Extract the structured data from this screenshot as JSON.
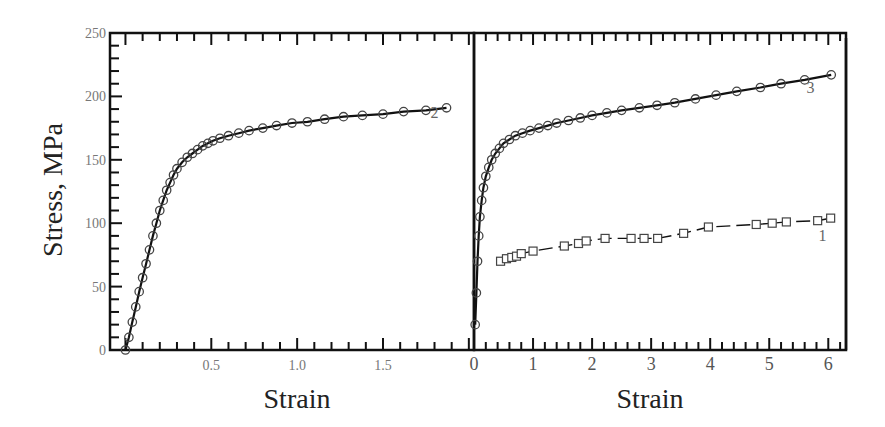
{
  "chart_data": [
    {
      "type": "scatter",
      "panel": "left",
      "title": "",
      "xlabel": "Strain",
      "ylabel": "Stress, MPa",
      "xlim": [
        -0.09,
        2.03
      ],
      "ylim": [
        0,
        250
      ],
      "x_ticks": [
        0.5,
        1.0,
        1.5
      ],
      "x_tick_labels": [
        "0.5",
        "1.0",
        "1.5"
      ],
      "y_ticks": [
        0,
        50,
        100,
        150,
        200,
        250
      ],
      "y_tick_labels": [
        "0",
        "50",
        "100",
        "150",
        "200",
        "250"
      ],
      "grid": false,
      "series": [
        {
          "name": "2",
          "marker": "circle",
          "line": "solid",
          "x": [
            0.0,
            0.02,
            0.04,
            0.06,
            0.08,
            0.1,
            0.12,
            0.14,
            0.16,
            0.18,
            0.2,
            0.22,
            0.24,
            0.26,
            0.28,
            0.3,
            0.33,
            0.36,
            0.39,
            0.42,
            0.45,
            0.48,
            0.51,
            0.55,
            0.6,
            0.66,
            0.72,
            0.8,
            0.88,
            0.97,
            1.06,
            1.16,
            1.27,
            1.38,
            1.5,
            1.62,
            1.75,
            1.87
          ],
          "y": [
            0,
            10,
            22,
            34,
            46,
            57,
            68,
            79,
            90,
            100,
            110,
            118,
            126,
            132,
            138,
            143,
            148,
            152,
            155,
            158,
            161,
            163,
            165,
            167,
            169,
            171,
            173,
            175,
            177,
            179,
            180,
            182,
            184,
            185,
            186,
            188,
            189,
            191
          ]
        }
      ],
      "annotations": [
        {
          "text": "2",
          "x": 1.8,
          "y": 183
        }
      ]
    },
    {
      "type": "scatter",
      "panel": "right",
      "title": "",
      "xlabel": "Strain",
      "ylabel": "",
      "xlim": [
        0,
        6.3
      ],
      "ylim": [
        0,
        250
      ],
      "x_ticks": [
        0,
        1,
        2,
        3,
        4,
        5,
        6
      ],
      "x_tick_labels": [
        "0",
        "1",
        "2",
        "3",
        "4",
        "5",
        "6"
      ],
      "grid": false,
      "series": [
        {
          "name": "3",
          "marker": "circle",
          "line": "solid",
          "x": [
            0.02,
            0.04,
            0.06,
            0.08,
            0.1,
            0.13,
            0.16,
            0.2,
            0.25,
            0.3,
            0.36,
            0.43,
            0.5,
            0.6,
            0.7,
            0.82,
            0.95,
            1.1,
            1.25,
            1.4,
            1.6,
            1.8,
            2.0,
            2.25,
            2.5,
            2.8,
            3.1,
            3.4,
            3.75,
            4.1,
            4.45,
            4.85,
            5.2,
            5.6,
            6.05
          ],
          "y": [
            20,
            45,
            70,
            90,
            105,
            118,
            128,
            137,
            144,
            150,
            155,
            159,
            163,
            166,
            169,
            171,
            173,
            175,
            177,
            179,
            181,
            183,
            185,
            187,
            189,
            191,
            193,
            195,
            198,
            201,
            204,
            207,
            210,
            213,
            217
          ]
        },
        {
          "name": "1",
          "marker": "square",
          "line": "dashed",
          "x": [
            0.45,
            0.55,
            0.64,
            0.72,
            0.8,
            1.0,
            1.53,
            1.77,
            1.9,
            2.22,
            2.66,
            2.88,
            3.11,
            3.55,
            3.97,
            4.78,
            5.05,
            5.29,
            5.82,
            6.04
          ],
          "y": [
            70,
            72,
            73,
            74,
            76,
            78,
            82,
            84,
            86,
            88,
            88,
            88,
            88,
            92,
            97,
            99,
            100,
            101,
            102,
            104
          ]
        }
      ],
      "annotations": [
        {
          "text": "3",
          "x": 5.7,
          "y": 203
        },
        {
          "text": "1",
          "x": 5.9,
          "y": 86
        }
      ]
    }
  ],
  "labels": {
    "ylabel": "Stress, MPa",
    "xlabel_left": "Strain",
    "xlabel_right": "Strain"
  }
}
